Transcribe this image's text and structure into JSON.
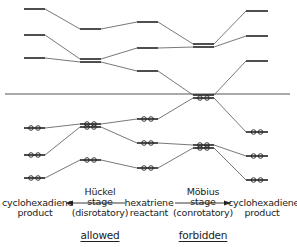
{
  "columns": [
    {
      "id": "cyclohexadiene-left",
      "x": 24,
      "w": 21,
      "levels": [
        {
          "y": 9,
          "occupied": false
        },
        {
          "y": 35,
          "occupied": false
        },
        {
          "y": 58,
          "occupied": false
        },
        {
          "y": 128,
          "occupied": true
        },
        {
          "y": 155,
          "occupied": true
        },
        {
          "y": 178,
          "occupied": true
        }
      ]
    },
    {
      "id": "huckel-stage",
      "x": 80,
      "w": 21,
      "levels": [
        {
          "y": 29,
          "occupied": false
        },
        {
          "y": 59,
          "occupied": false
        },
        {
          "y": 62,
          "occupied": false
        },
        {
          "y": 124,
          "occupied": true
        },
        {
          "y": 127,
          "occupied": true
        },
        {
          "y": 160,
          "occupied": true
        }
      ]
    },
    {
      "id": "hexatriene",
      "x": 137,
      "w": 21,
      "levels": [
        {
          "y": 22,
          "occupied": false
        },
        {
          "y": 48,
          "occupied": false
        },
        {
          "y": 71,
          "occupied": false
        },
        {
          "y": 119,
          "occupied": true
        },
        {
          "y": 143,
          "occupied": true
        },
        {
          "y": 168,
          "occupied": true
        }
      ]
    },
    {
      "id": "mobius-stage",
      "x": 193,
      "w": 21,
      "levels": [
        {
          "y": 44,
          "occupied": false
        },
        {
          "y": 47,
          "occupied": false
        },
        {
          "y": 95,
          "occupied": false
        },
        {
          "y": 98,
          "occupied": true
        },
        {
          "y": 145,
          "occupied": true
        },
        {
          "y": 148,
          "occupied": true
        }
      ]
    },
    {
      "id": "cyclohexadiene-right",
      "x": 246,
      "w": 22,
      "levels": [
        {
          "y": 11,
          "occupied": false
        },
        {
          "y": 36,
          "occupied": false
        },
        {
          "y": 61,
          "occupied": false
        },
        {
          "y": 132,
          "occupied": true
        },
        {
          "y": 156,
          "occupied": true
        },
        {
          "y": 180,
          "occupied": true
        }
      ]
    }
  ],
  "connectors": [
    [
      45,
      9,
      80,
      29
    ],
    [
      45,
      35,
      80,
      59
    ],
    [
      45,
      58,
      80,
      62
    ],
    [
      101,
      29,
      137,
      22
    ],
    [
      101,
      59,
      137,
      48
    ],
    [
      101,
      62,
      137,
      71
    ],
    [
      45,
      128,
      80,
      124
    ],
    [
      45,
      155,
      80,
      127
    ],
    [
      45,
      178,
      80,
      160
    ],
    [
      101,
      124,
      137,
      119
    ],
    [
      101,
      127,
      137,
      143
    ],
    [
      101,
      160,
      137,
      168
    ],
    [
      158,
      22,
      193,
      44
    ],
    [
      158,
      48,
      193,
      47
    ],
    [
      158,
      71,
      193,
      95
    ],
    [
      214,
      44,
      246,
      11
    ],
    [
      214,
      47,
      246,
      36
    ],
    [
      214,
      95,
      246,
      61
    ],
    [
      158,
      119,
      193,
      98
    ],
    [
      158,
      143,
      193,
      145
    ],
    [
      158,
      168,
      193,
      148
    ],
    [
      214,
      98,
      246,
      132
    ],
    [
      214,
      145,
      246,
      156
    ],
    [
      214,
      148,
      246,
      180
    ]
  ],
  "nonbonding_line": {
    "x1": 5,
    "y": 94,
    "x2": 290
  },
  "labels": {
    "left_product_line1": "cyclohexadiene",
    "left_product_line2": "product",
    "huckel_line1": "Hückel",
    "huckel_line2": "stage",
    "huckel_line3": "(disrotatory)",
    "reactant_line1": "hexatriene",
    "reactant_line2": "reactant",
    "mobius_line1": "Möbius",
    "mobius_line2": "stage",
    "mobius_line3": "(conrotatory)",
    "right_product_line1": "cyclohexadiene",
    "right_product_line2": "product",
    "allowed": "allowed",
    "forbidden": "forbidden"
  },
  "arrows": [
    {
      "id": "to-left-product",
      "x1": 125,
      "x2": 66,
      "y": 203
    },
    {
      "id": "to-right-product",
      "x1": 175,
      "x2": 231,
      "y": 203
    }
  ],
  "colors": {
    "ink": "#222222",
    "line": "#555555",
    "background": "#ffffff"
  }
}
